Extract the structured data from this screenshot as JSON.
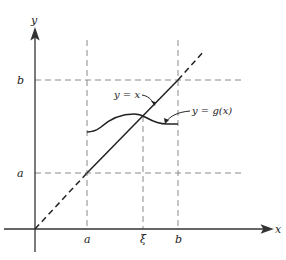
{
  "diagram": {
    "axes": {
      "x_label": "x",
      "y_label": "y"
    },
    "tick_labels": {
      "x_a": "a",
      "x_xi": "ξ",
      "x_b": "b",
      "y_a": "a",
      "y_b": "b"
    },
    "curves": {
      "identity_label": "y = x",
      "g_label": "y = g(x)"
    },
    "colors": {
      "ink": "#222222",
      "guide": "#777777"
    }
  }
}
